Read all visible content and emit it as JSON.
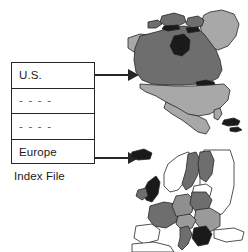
{
  "diagram": {
    "caption": "Index File",
    "index_table": {
      "rows": [
        {
          "label": "U.S.",
          "type": "entry",
          "has_connector": true
        },
        {
          "label": "- - - -",
          "type": "placeholder",
          "has_connector": false
        },
        {
          "label": "- - - -",
          "type": "placeholder",
          "has_connector": false
        },
        {
          "label": "Europe",
          "type": "entry",
          "has_connector": true
        }
      ]
    },
    "connectors": [
      {
        "from_row": "U.S.",
        "to_map": "north-america",
        "style": "arrow"
      },
      {
        "from_row": "Europe",
        "to_map": "europe",
        "style": "arrow"
      }
    ],
    "maps": [
      {
        "id": "north-america",
        "name": "North America",
        "regions": [
          {
            "name": "Canada",
            "shade": "#6e6e6e"
          },
          {
            "name": "United States",
            "shade": "#a8a8a8"
          },
          {
            "name": "Mexico",
            "shade": "#a8a8a8"
          },
          {
            "name": "Greenland",
            "shade": "#a8a8a8"
          },
          {
            "name": "Alaska",
            "shade": "#a8a8a8"
          },
          {
            "name": "Great Lakes",
            "shade": "#1a1a1a"
          },
          {
            "name": "Hudson Bay",
            "shade": "#1a1a1a"
          },
          {
            "name": "Caribbean Islands",
            "shade": "#1a1a1a"
          }
        ]
      },
      {
        "id": "europe",
        "name": "Europe",
        "regions": [
          {
            "name": "Scandinavia",
            "shade": "#ffffff"
          },
          {
            "name": "Sweden",
            "shade": "#6e6e6e"
          },
          {
            "name": "Finland",
            "shade": "#6e6e6e"
          },
          {
            "name": "United Kingdom",
            "shade": "#1a1a1a"
          },
          {
            "name": "Ireland",
            "shade": "#6e6e6e"
          },
          {
            "name": "France",
            "shade": "#6e6e6e"
          },
          {
            "name": "Germany",
            "shade": "#8f8f8f"
          },
          {
            "name": "Poland",
            "shade": "#6e6e6e"
          },
          {
            "name": "Spain",
            "shade": "#ffffff"
          },
          {
            "name": "Italy",
            "shade": "#6e6e6e"
          },
          {
            "name": "Balkans",
            "shade": "#1a1a1a"
          },
          {
            "name": "Eastern Europe",
            "shade": "#9a9a9a"
          },
          {
            "name": "Russia West",
            "shade": "#ffffff"
          },
          {
            "name": "North Africa",
            "shade": "#ffffff"
          },
          {
            "name": "Iceland",
            "shade": "#1a1a1a"
          }
        ]
      }
    ],
    "colors": {
      "outline": "#262626",
      "dark_region": "#6e6e6e",
      "light_region": "#a8a8a8",
      "black_region": "#1a1a1a",
      "background": "#ffffff"
    }
  }
}
